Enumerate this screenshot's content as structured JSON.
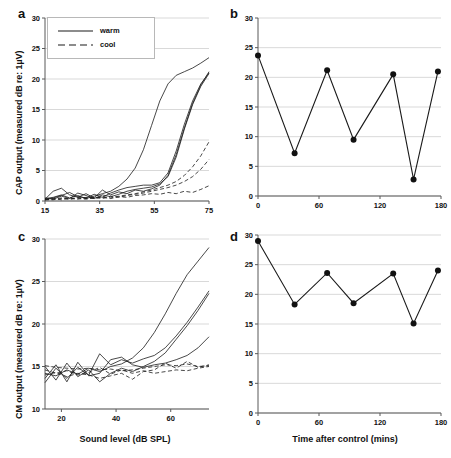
{
  "figure": {
    "panels": [
      "a",
      "b",
      "c",
      "d"
    ]
  },
  "panel_a": {
    "letter": "a",
    "legend": [
      {
        "label": "warm",
        "style": "solid"
      },
      {
        "label": "cool",
        "style": "dashed"
      }
    ]
  },
  "panel_b": {
    "letter": "b"
  },
  "panel_c": {
    "letter": "c"
  },
  "panel_d": {
    "letter": "d"
  },
  "chart_data": [
    {
      "panel": "a",
      "type": "line",
      "title": "",
      "xlabel": "",
      "ylabel": "CAP output (measured dB re: 1µV)",
      "xlim": [
        15,
        75
      ],
      "ylim": [
        0,
        30
      ],
      "xticks": [
        15,
        35,
        55,
        75
      ],
      "yticks": [
        0,
        5,
        10,
        15,
        20,
        25,
        30
      ],
      "grid": true,
      "legend": [
        "warm",
        "cool"
      ],
      "legend_position": "top-left",
      "series": [
        {
          "name": "warm-1",
          "style": "solid",
          "x": [
            15,
            18,
            21,
            24,
            27,
            30,
            33,
            36,
            39,
            42,
            45,
            48,
            51,
            54,
            57,
            60,
            63,
            66,
            69,
            72,
            75
          ],
          "y": [
            0.4,
            0.6,
            1.0,
            0.5,
            0.9,
            0.4,
            0.8,
            1.2,
            1.6,
            2.4,
            3.6,
            5.4,
            8.4,
            12.4,
            16.4,
            19.2,
            20.6,
            21.2,
            21.8,
            22.6,
            23.5
          ]
        },
        {
          "name": "warm-2",
          "style": "solid",
          "x": [
            15,
            18,
            21,
            24,
            27,
            30,
            33,
            36,
            39,
            42,
            45,
            48,
            51,
            54,
            57,
            60,
            63,
            66,
            69,
            72,
            75
          ],
          "y": [
            0.3,
            1.6,
            2.1,
            1.0,
            0.6,
            1.2,
            0.5,
            1.8,
            1.0,
            1.5,
            1.2,
            1.8,
            1.6,
            2.0,
            2.6,
            4.2,
            7.6,
            12.0,
            16.0,
            19.0,
            21.2
          ]
        },
        {
          "name": "warm-3",
          "style": "solid",
          "x": [
            15,
            18,
            21,
            24,
            27,
            30,
            33,
            36,
            39,
            42,
            45,
            48,
            51,
            54,
            57,
            60,
            63,
            66,
            69,
            72,
            75
          ],
          "y": [
            0.2,
            0.5,
            0.9,
            1.4,
            0.7,
            0.5,
            1.1,
            0.6,
            1.3,
            1.8,
            2.2,
            2.4,
            2.6,
            2.6,
            3.0,
            4.6,
            8.2,
            12.6,
            16.4,
            19.2,
            21.0
          ]
        },
        {
          "name": "warm-4",
          "style": "solid",
          "x": [
            15,
            18,
            21,
            24,
            27,
            30,
            33,
            36,
            39,
            42,
            45,
            48,
            51,
            54,
            57,
            60,
            63,
            66,
            69,
            72,
            75
          ],
          "y": [
            0.5,
            0.3,
            0.8,
            0.4,
            1.3,
            0.9,
            0.4,
            1.0,
            0.7,
            1.1,
            1.6,
            1.9,
            2.1,
            2.3,
            2.8,
            4.0,
            7.2,
            11.8,
            15.8,
            18.8,
            20.9
          ]
        },
        {
          "name": "cool-1",
          "style": "dashed",
          "x": [
            15,
            18,
            21,
            24,
            27,
            30,
            33,
            36,
            39,
            42,
            45,
            48,
            51,
            54,
            57,
            60,
            63,
            66,
            69,
            72,
            75
          ],
          "y": [
            0.3,
            0.4,
            0.2,
            0.5,
            0.3,
            0.6,
            0.4,
            0.7,
            0.5,
            0.8,
            1.0,
            1.2,
            1.5,
            1.8,
            2.2,
            2.6,
            3.2,
            4.2,
            5.6,
            7.4,
            9.7
          ]
        },
        {
          "name": "cool-2",
          "style": "dashed",
          "x": [
            15,
            18,
            21,
            24,
            27,
            30,
            33,
            36,
            39,
            42,
            45,
            48,
            51,
            54,
            57,
            60,
            63,
            66,
            69,
            72,
            75
          ],
          "y": [
            0.2,
            0.3,
            0.5,
            0.3,
            0.6,
            0.4,
            0.6,
            0.4,
            0.8,
            0.6,
            0.9,
            1.1,
            1.3,
            1.6,
            1.9,
            2.2,
            2.6,
            3.2,
            4.0,
            5.2,
            6.8
          ]
        },
        {
          "name": "cool-3",
          "style": "dashed",
          "x": [
            15,
            18,
            21,
            24,
            27,
            30,
            33,
            36,
            39,
            42,
            45,
            48,
            51,
            54,
            57,
            60,
            63,
            66,
            69,
            72,
            75
          ],
          "y": [
            0.2,
            0.2,
            0.4,
            0.3,
            0.4,
            0.3,
            0.5,
            0.6,
            0.4,
            0.7,
            0.6,
            0.9,
            1.0,
            1.2,
            1.1,
            1.4,
            1.2,
            1.6,
            1.4,
            1.9,
            2.5
          ]
        }
      ]
    },
    {
      "panel": "b",
      "type": "line",
      "title": "",
      "xlabel": "",
      "ylabel": "",
      "xlim": [
        0,
        180
      ],
      "ylim": [
        0,
        30
      ],
      "xticks": [
        0,
        60,
        120,
        180
      ],
      "yticks": [
        0,
        5,
        10,
        15,
        20,
        25,
        30
      ],
      "grid": true,
      "markers": "filled-circle",
      "x": [
        0,
        36,
        68,
        94,
        133,
        153,
        177
      ],
      "values": [
        23.7,
        7.2,
        21.2,
        9.5,
        20.5,
        2.8,
        21.0
      ]
    },
    {
      "panel": "c",
      "type": "line",
      "title": "",
      "xlabel": "Sound level (dB SPL)",
      "ylabel": "CM output (measured dB re: 1µV)",
      "xlim": [
        14,
        74
      ],
      "ylim": [
        10,
        30
      ],
      "xticks": [
        20,
        40,
        60
      ],
      "yticks": [
        10,
        15,
        20,
        25,
        30
      ],
      "grid": true,
      "legend": [
        "warm",
        "cool"
      ],
      "series": [
        {
          "name": "warm-1",
          "style": "solid",
          "x": [
            14,
            18,
            22,
            26,
            30,
            34,
            38,
            42,
            46,
            50,
            54,
            58,
            62,
            66,
            70,
            74
          ],
          "y": [
            14.2,
            13.9,
            14.6,
            14.1,
            14.8,
            14.4,
            15.0,
            15.3,
            16.0,
            17.2,
            19.0,
            21.2,
            23.6,
            25.8,
            27.4,
            29.0
          ]
        },
        {
          "name": "warm-2",
          "style": "solid",
          "x": [
            14,
            18,
            22,
            26,
            30,
            34,
            38,
            42,
            46,
            50,
            54,
            58,
            62,
            66,
            70,
            74
          ],
          "y": [
            13.1,
            14.8,
            13.6,
            14.9,
            14.0,
            16.5,
            15.2,
            15.8,
            15.4,
            15.9,
            16.3,
            17.2,
            18.6,
            20.2,
            22.0,
            23.9
          ]
        },
        {
          "name": "warm-3",
          "style": "solid",
          "x": [
            14,
            18,
            22,
            26,
            30,
            34,
            38,
            42,
            46,
            50,
            54,
            58,
            62,
            66,
            70,
            74
          ],
          "y": [
            15.0,
            13.4,
            15.4,
            13.8,
            14.6,
            13.2,
            14.2,
            14.8,
            14.4,
            15.0,
            15.6,
            16.6,
            18.2,
            19.8,
            21.6,
            23.6
          ]
        },
        {
          "name": "warm-4",
          "style": "solid",
          "x": [
            14,
            18,
            22,
            26,
            30,
            34,
            38,
            42,
            46,
            50,
            54,
            58,
            62,
            66,
            70,
            74
          ],
          "y": [
            13.6,
            15.2,
            13.2,
            15.5,
            13.9,
            14.2,
            15.8,
            16.1,
            15.2,
            14.9,
            15.2,
            15.4,
            15.8,
            16.3,
            17.2,
            18.5
          ]
        },
        {
          "name": "cool-1",
          "style": "dashed",
          "x": [
            14,
            18,
            22,
            26,
            30,
            34,
            38,
            42,
            46,
            50,
            54,
            58,
            62,
            66,
            70,
            74
          ],
          "y": [
            15.1,
            14.9,
            14.8,
            14.7,
            14.8,
            14.6,
            14.7,
            14.5,
            14.6,
            14.8,
            15.0,
            15.2,
            15.1,
            15.3,
            15.0,
            15.1
          ]
        },
        {
          "name": "cool-2",
          "style": "dashed",
          "x": [
            14,
            18,
            22,
            26,
            30,
            34,
            38,
            42,
            46,
            50,
            54,
            58,
            62,
            66,
            70,
            74
          ],
          "y": [
            14.0,
            14.3,
            13.8,
            14.2,
            14.0,
            13.6,
            13.9,
            14.2,
            13.5,
            14.4,
            14.6,
            15.4,
            14.8,
            15.6,
            14.9,
            15.2
          ]
        },
        {
          "name": "cool-3",
          "style": "dashed",
          "x": [
            14,
            18,
            22,
            26,
            30,
            34,
            38,
            42,
            46,
            50,
            54,
            58,
            62,
            66,
            70,
            74
          ],
          "y": [
            14.6,
            14.2,
            14.5,
            14.0,
            14.3,
            14.9,
            14.1,
            14.6,
            14.2,
            14.5,
            14.2,
            14.4,
            14.6,
            14.5,
            14.8,
            15.0
          ]
        }
      ]
    },
    {
      "panel": "d",
      "type": "line",
      "title": "",
      "xlabel": "Time after control (mins)",
      "ylabel": "",
      "xlim": [
        0,
        180
      ],
      "ylim": [
        0,
        30
      ],
      "xticks": [
        0,
        60,
        120,
        180
      ],
      "yticks": [
        0,
        5,
        10,
        15,
        20,
        25,
        30
      ],
      "grid": true,
      "markers": "filled-circle",
      "x": [
        0,
        36,
        68,
        94,
        133,
        153,
        177
      ],
      "values": [
        29.0,
        18.3,
        23.6,
        18.5,
        23.5,
        15.1,
        24.0
      ]
    }
  ]
}
